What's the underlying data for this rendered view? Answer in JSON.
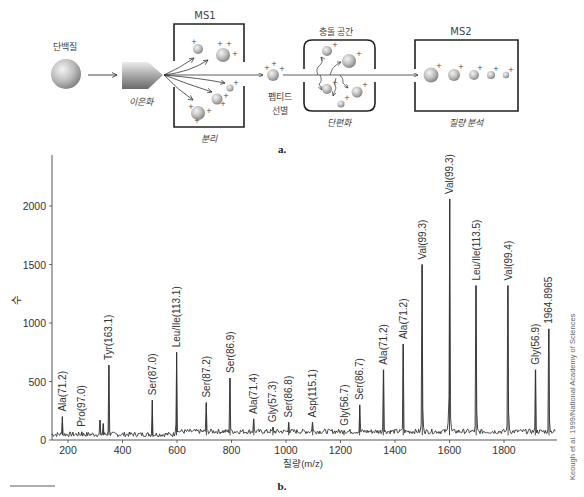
{
  "diagram": {
    "part_label": "a.",
    "protein_label": "단백질",
    "ionization_label": "이온화",
    "ms1_label": "MS1",
    "separation_label": "분리",
    "peptide_selection_label": [
      "펩티드",
      "선별"
    ],
    "collision_label": "충돌 공간",
    "fragmentation_label": "단편화",
    "ms2_label": "MS2",
    "mass_analysis_label": "질량 분석"
  },
  "chart_data": {
    "type": "line",
    "part_label": "b.",
    "title": "",
    "xlabel": "질량(m/z)",
    "ylabel": "수",
    "xlim": [
      140,
      1990
    ],
    "ylim": [
      0,
      2450
    ],
    "xticks": [
      200,
      400,
      600,
      800,
      1000,
      1200,
      1400,
      1600,
      1800
    ],
    "yticks": [
      0,
      500,
      1000,
      1500,
      2000
    ],
    "grid": false,
    "legend": null,
    "baseline_noise_level": 60,
    "peaks": [
      {
        "x": 180,
        "y": 200,
        "label": "Ala(71.2)"
      },
      {
        "x": 250,
        "y": 70,
        "label": "Pro(97.0)"
      },
      {
        "x": 318,
        "y": 170,
        "label": ""
      },
      {
        "x": 330,
        "y": 140,
        "label": ""
      },
      {
        "x": 350,
        "y": 640,
        "label": "Tyr(163.1)"
      },
      {
        "x": 510,
        "y": 340,
        "label": "Ser(87.0)"
      },
      {
        "x": 598,
        "y": 750,
        "label": "Leu/Ile(113.1)"
      },
      {
        "x": 708,
        "y": 320,
        "label": "Ser(87.2)"
      },
      {
        "x": 795,
        "y": 530,
        "label": "Ser(86.9)"
      },
      {
        "x": 882,
        "y": 180,
        "label": "Ala(71.4)"
      },
      {
        "x": 952,
        "y": 110,
        "label": "Gly(57.3)"
      },
      {
        "x": 1010,
        "y": 150,
        "label": "Ser(86.8)"
      },
      {
        "x": 1098,
        "y": 150,
        "label": "Asp(115.1)"
      },
      {
        "x": 1213,
        "y": 80,
        "label": "Gly(56.7)"
      },
      {
        "x": 1270,
        "y": 300,
        "label": "Ser(86.7)"
      },
      {
        "x": 1357,
        "y": 600,
        "label": "Ala(71.2)"
      },
      {
        "x": 1430,
        "y": 820,
        "label": "Ala(71.2)"
      },
      {
        "x": 1500,
        "y": 1500,
        "label": "Val(99.3)"
      },
      {
        "x": 1600,
        "y": 2060,
        "label": "Val(99.3)"
      },
      {
        "x": 1698,
        "y": 1320,
        "label": "Leu/Ile(113.5)"
      },
      {
        "x": 1815,
        "y": 1320,
        "label": "Val(99.4)"
      },
      {
        "x": 1915,
        "y": 600,
        "label": "Gly(56.9)"
      },
      {
        "x": 1965,
        "y": 950,
        "label": "1964.8965"
      }
    ],
    "credit": "Keough et al. 1999/National Academy of Sciences"
  }
}
